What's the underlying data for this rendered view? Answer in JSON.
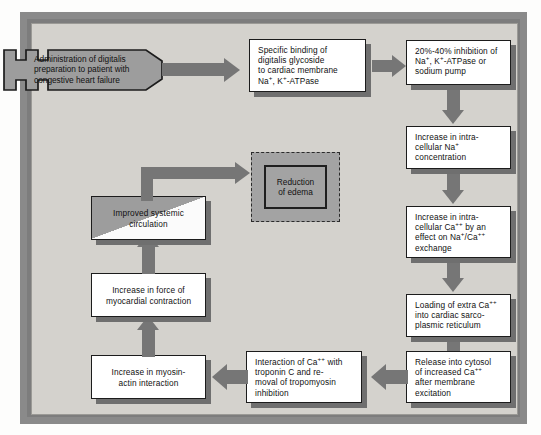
{
  "diagram": {
    "frame_color": "#8a8a8a",
    "background_color": "#d4d2cd",
    "arrow_color": "#767676",
    "box_fill": "#ffffff",
    "accent_gray": "#9d9d9d"
  },
  "nodes": {
    "start": {
      "id": "administration",
      "lines": [
        "Administration of digitalis",
        "preparation to patient with",
        "congestive heart failure"
      ],
      "shape": "plug"
    },
    "binding": {
      "id": "specific-binding",
      "lines": [
        "Specific binding of",
        "digitalis glycoside",
        "to cardiac membrane",
        "Na+, K+-ATPase"
      ],
      "shape": "box"
    },
    "inhibition": {
      "id": "inhibition",
      "lines": [
        "20%-40% inhibition of",
        "Na+, K+-ATPase or",
        "sodium pump"
      ],
      "shape": "box"
    },
    "sodium": {
      "id": "intracellular-sodium",
      "lines": [
        "Increase in intra-",
        "cellular Na+",
        "concentration"
      ],
      "shape": "box"
    },
    "calcium": {
      "id": "intracellular-calcium",
      "lines": [
        "Increase in intra-",
        "cellular Ca++ by an",
        "effect on Na+/Ca++",
        "exchange"
      ],
      "shape": "box"
    },
    "loading": {
      "id": "sarcoplasmic-loading",
      "lines": [
        "Loading of extra Ca++",
        "into cardiac sarco-",
        "plasmic reticulum"
      ],
      "shape": "box"
    },
    "release": {
      "id": "cytosol-release",
      "lines": [
        "Release into cytosol",
        "of increased Ca++",
        "after membrane",
        "excitation"
      ],
      "shape": "box"
    },
    "troponin": {
      "id": "troponin-interaction",
      "lines": [
        "Interaction of Ca++ with",
        "troponin C and re-",
        "moval of tropomyosin",
        "inhibition"
      ],
      "shape": "box"
    },
    "myosin": {
      "id": "myosin-actin",
      "lines": [
        "Increase in myosin-",
        "actin interaction"
      ],
      "shape": "box"
    },
    "force": {
      "id": "myocardial-force",
      "lines": [
        "Increase in force of",
        "myocardial contraction"
      ],
      "shape": "box"
    },
    "circulation": {
      "id": "systemic-circulation",
      "lines": [
        "Improved systemic",
        "circulation"
      ],
      "shape": "split-box"
    },
    "edema": {
      "id": "reduction-of-edema",
      "lines": [
        "Reduction",
        "of edema"
      ],
      "shape": "dashed-box"
    }
  },
  "edges": [
    {
      "from": "administration",
      "to": "specific-binding",
      "direction": "right"
    },
    {
      "from": "specific-binding",
      "to": "inhibition",
      "direction": "right"
    },
    {
      "from": "inhibition",
      "to": "intracellular-sodium",
      "direction": "down"
    },
    {
      "from": "intracellular-sodium",
      "to": "intracellular-calcium",
      "direction": "down"
    },
    {
      "from": "intracellular-calcium",
      "to": "sarcoplasmic-loading",
      "direction": "down"
    },
    {
      "from": "sarcoplasmic-loading",
      "to": "cytosol-release",
      "direction": "down"
    },
    {
      "from": "cytosol-release",
      "to": "troponin-interaction",
      "direction": "left"
    },
    {
      "from": "troponin-interaction",
      "to": "myosin-actin",
      "direction": "left"
    },
    {
      "from": "myosin-actin",
      "to": "myocardial-force",
      "direction": "up"
    },
    {
      "from": "myocardial-force",
      "to": "systemic-circulation",
      "direction": "up"
    },
    {
      "from": "systemic-circulation",
      "to": "reduction-of-edema",
      "direction": "up-right"
    }
  ]
}
